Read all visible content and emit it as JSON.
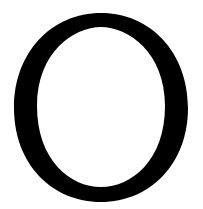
{
  "glyph": {
    "character": "O",
    "color": "#000000",
    "background": "#ffffff",
    "style": "serif capital"
  }
}
